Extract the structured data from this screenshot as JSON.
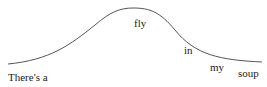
{
  "diagram": {
    "type": "bell-curve-with-words",
    "curve_color": "#555555",
    "words": [
      {
        "id": "w0",
        "text": "There's a",
        "x": 8,
        "y": 72
      },
      {
        "id": "w1",
        "text": "fly",
        "x": 134,
        "y": 18
      },
      {
        "id": "w2",
        "text": "in",
        "x": 184,
        "y": 45
      },
      {
        "id": "w3",
        "text": "my",
        "x": 210,
        "y": 62
      },
      {
        "id": "w4",
        "text": "soup",
        "x": 238,
        "y": 68
      }
    ]
  }
}
